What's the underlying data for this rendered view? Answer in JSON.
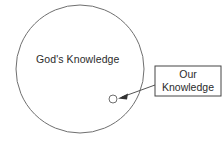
{
  "diagram": {
    "type": "venn-style concept diagram",
    "canvas": {
      "width": 224,
      "height": 141,
      "background": "#ffffff"
    },
    "outer_circle": {
      "label": "God's Knowledge",
      "center_x": 80,
      "center_y": 69,
      "radius": 64,
      "stroke_color": "#6f6f6f"
    },
    "inner_circle": {
      "label": "",
      "center_x": 113,
      "center_y": 99,
      "radius": 4,
      "stroke_color": "#555555"
    },
    "callout_box": {
      "line1": "Our",
      "line2": "Knowledge",
      "x": 155,
      "y": 66,
      "width": 66,
      "height": 30,
      "stroke_color": "#444444",
      "fill_color": "#ffffff"
    },
    "connector": {
      "from_x": 155,
      "from_y": 85,
      "to_x": 119,
      "to_y": 98,
      "stroke_color": "#555555",
      "arrow_head": "filled-triangle"
    }
  }
}
